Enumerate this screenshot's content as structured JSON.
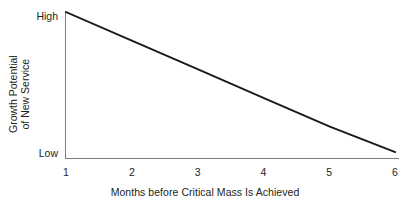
{
  "chart_data": {
    "type": "line",
    "title": "",
    "xlabel": "Months before Critical Mass Is Achieved",
    "ylabel": "Growth Potential of New Service",
    "ylabel_line1": "Growth Potential",
    "ylabel_line2": "of New Service",
    "x": [
      1,
      2,
      3,
      4,
      5,
      6
    ],
    "xticklabels": [
      "1",
      "2",
      "3",
      "4",
      "5",
      "6"
    ],
    "xlim": [
      1,
      6
    ],
    "ylim": [
      0,
      100
    ],
    "yticklabels": [
      "High",
      "Low"
    ],
    "ytick_high": "High",
    "ytick_low": "Low",
    "grid": false,
    "legend": false,
    "series": [
      {
        "name": "Growth Potential of New Service",
        "values": [
          100,
          80,
          60,
          40,
          20,
          2
        ],
        "color": "#1a1a1a",
        "marker": "none"
      }
    ],
    "annotations": [],
    "axis_color": "#7d7d7d",
    "background_color": "#ffffff"
  }
}
